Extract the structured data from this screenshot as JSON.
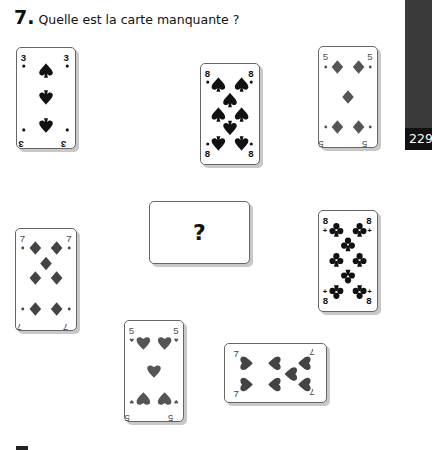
{
  "header": {
    "number": "7.",
    "question": "Quelle est la carte manquante ?"
  },
  "side_tab": {
    "page_number": "229",
    "color": "#3a3a3a"
  },
  "cards": [
    {
      "id": "three-spades",
      "rank": "3",
      "suit": "spades",
      "color": "#111111"
    },
    {
      "id": "eight-spades",
      "rank": "8",
      "suit": "spades",
      "color": "#111111"
    },
    {
      "id": "five-diamonds",
      "rank": "5",
      "suit": "diamonds",
      "color": "#555555"
    },
    {
      "id": "missing-card",
      "rank": "?",
      "suit": "unknown"
    },
    {
      "id": "seven-diamonds",
      "rank": "7",
      "suit": "diamonds",
      "color": "#444444"
    },
    {
      "id": "eight-clubs",
      "rank": "8",
      "suit": "clubs",
      "color": "#111111"
    },
    {
      "id": "five-hearts",
      "rank": "5",
      "suit": "hearts",
      "color": "#555555"
    },
    {
      "id": "seven-hearts",
      "rank": "7",
      "suit": "hearts",
      "color": "#444444",
      "orientation": "landscape"
    }
  ],
  "missing": {
    "label": "?"
  }
}
